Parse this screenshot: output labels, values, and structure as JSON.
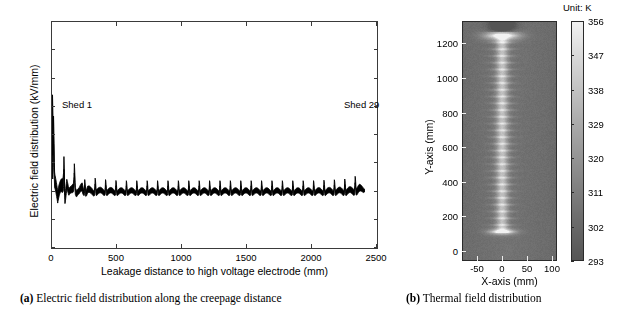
{
  "figure": {
    "panels": [
      {
        "tag": "(a)",
        "caption_text": "Electric field distribution along the creepage distance",
        "caption_full": "(a) Electric field distribution along the creepage distance"
      },
      {
        "tag": "(b)",
        "caption_text": "Thermal field distribution",
        "caption_full": "(b) Thermal field distribution"
      }
    ]
  },
  "panel_a": {
    "annotations": {
      "shed_first": "Shed 1",
      "shed_last": "Shed 29"
    },
    "line_color": "#000000",
    "axis_color": "#3a3a3a"
  },
  "panel_b": {
    "colorbar_unit": "Unit: K",
    "colormap": "gray",
    "background_color": "#555555",
    "hot_color": "#f2f2f2"
  },
  "chart_data": [
    {
      "type": "line",
      "id": "electric-field",
      "title": "",
      "xlabel": "Leakage distance to high voltage electrode (mm)",
      "ylabel": "Electric field distribution (kV/mm)",
      "xlim": [
        0,
        2500
      ],
      "ylim": [
        -1,
        3
      ],
      "xticks": [
        0,
        500,
        1000,
        1500,
        2000,
        2500
      ],
      "xticklabels": [
        "0",
        "500",
        "1000",
        "1500",
        "2000",
        "2500"
      ],
      "yticks": [
        -1,
        -0.5,
        0,
        0.5,
        1,
        1.5,
        2,
        2.5,
        3
      ],
      "yticklabels": [
        "-1",
        "-0.5",
        "0",
        "0.5",
        "1",
        "1.5",
        "2",
        "2.5",
        "3"
      ],
      "grid": false,
      "legend": null,
      "annotations": [
        {
          "text": "Shed 1",
          "x": 90,
          "y": 1.72
        },
        {
          "text": "Shed 29",
          "x": 2330,
          "y": 1.72
        }
      ],
      "series": [
        {
          "name": "Electric field magnitude (upper envelope / peaks)",
          "comment": "29 shed peaks; decaying near HV electrode then near-uniform",
          "x": [
            0,
            20,
            40,
            60,
            83,
            95,
            110,
            125,
            145,
            165,
            185,
            205,
            228,
            250,
            270,
            292,
            312,
            335,
            360,
            385,
            410,
            440,
            470,
            500,
            560,
            620,
            700,
            800,
            900,
            1000,
            1100,
            1200,
            1300,
            1400,
            1500,
            1600,
            1700,
            1800,
            1900,
            2000,
            2100,
            2200,
            2300,
            2360,
            2400
          ],
          "values": [
            1.72,
            0.78,
            0.33,
            0.52,
            0.86,
            0.3,
            0.52,
            0.22,
            0.3,
            0.55,
            0.22,
            0.21,
            0.42,
            0.2,
            0.3,
            0.24,
            0.21,
            0.26,
            0.22,
            0.21,
            0.22,
            0.21,
            0.21,
            0.2,
            0.2,
            0.2,
            0.2,
            0.2,
            0.2,
            0.2,
            0.2,
            0.2,
            0.2,
            0.2,
            0.2,
            0.2,
            0.2,
            0.2,
            0.2,
            0.2,
            0.21,
            0.22,
            0.24,
            0.32,
            0.17
          ]
        },
        {
          "name": "Electric field magnitude (lower envelope / troughs)",
          "x": [
            0,
            20,
            40,
            60,
            83,
            95,
            110,
            125,
            145,
            165,
            185,
            205,
            228,
            250,
            270,
            292,
            312,
            335,
            360,
            385,
            410,
            440,
            470,
            500,
            560,
            620,
            700,
            800,
            900,
            1000,
            1100,
            1200,
            1300,
            1400,
            1500,
            1600,
            1700,
            1800,
            1900,
            2000,
            2100,
            2200,
            2300,
            2360,
            2400
          ],
          "values": [
            0.25,
            0.05,
            -0.31,
            -0.1,
            0.02,
            -0.22,
            0.0,
            -0.12,
            -0.05,
            0.02,
            -0.1,
            -0.08,
            -0.02,
            -0.09,
            -0.05,
            -0.07,
            -0.07,
            -0.06,
            -0.06,
            -0.06,
            -0.06,
            -0.06,
            -0.06,
            -0.06,
            -0.06,
            -0.06,
            -0.06,
            -0.06,
            -0.06,
            -0.06,
            -0.06,
            -0.06,
            -0.06,
            -0.06,
            -0.06,
            -0.06,
            -0.06,
            -0.06,
            -0.06,
            -0.06,
            -0.06,
            -0.06,
            -0.06,
            -0.05,
            0.0
          ]
        }
      ],
      "peak_count": 29,
      "peak_spacing_mm": 80,
      "steady_peak_value": 0.2,
      "steady_trough_value": -0.06,
      "max_value": 1.72
    },
    {
      "type": "heatmap",
      "id": "thermal-field",
      "title": "",
      "xlabel": "X-axis (mm)",
      "ylabel": "Y-axis (mm)",
      "xlim": [
        -80,
        110
      ],
      "ylim": [
        -60,
        1330
      ],
      "xticks": [
        -50,
        0,
        50,
        100
      ],
      "xticklabels": [
        "-50",
        "0",
        "50",
        "100"
      ],
      "yticks": [
        0,
        200,
        400,
        600,
        800,
        1000,
        1200
      ],
      "yticklabels": [
        "0",
        "200",
        "400",
        "600",
        "800",
        "1000",
        "1200"
      ],
      "colorbar": {
        "label": "Unit: K",
        "ticks": [
          293,
          302,
          311,
          320,
          329,
          338,
          347,
          356
        ],
        "ticklabels": [
          "293",
          "302",
          "311",
          "320",
          "329",
          "338",
          "347",
          "356"
        ],
        "vmin": 293,
        "vmax": 356,
        "colormap": "gray",
        "position": "right"
      },
      "features": {
        "background_temp_K": 305,
        "core_column_temp_K": 330,
        "top_flare_temp_K": 352,
        "bottom_flare_temp_K": 348,
        "column_center_x_mm": 0,
        "column_half_width_mm": 9,
        "shed_rib_count": 29,
        "top_flare_y_mm": 1250,
        "bottom_flare_y_mm": 105
      }
    }
  ]
}
